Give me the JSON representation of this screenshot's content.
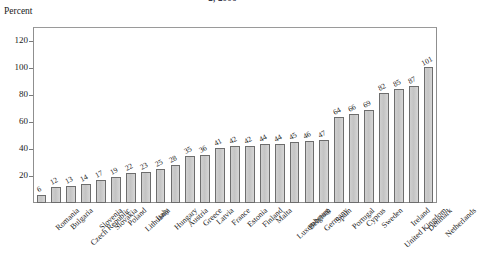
{
  "chart_data": {
    "type": "bar",
    "title": "2, 2006",
    "subtitle": "",
    "xlabel": "",
    "ylabel": "Percent",
    "ylim": [
      0,
      130
    ],
    "yticks": [
      20,
      40,
      60,
      80,
      100,
      120
    ],
    "grid": false,
    "legend": null,
    "orientation": "vertical",
    "bar_color": "#c8c8c8",
    "bar_edge_color": "#6d6d6d",
    "value_labels_shown": true,
    "categories": [
      "Romania",
      "Bulgaria",
      "Czech Republic",
      "Slovenia",
      "Slovakia",
      "Poland",
      "Lithuania",
      "Italy",
      "Hungary",
      "Austria",
      "Greece",
      "Latvia",
      "France",
      "Estonia",
      "Finland",
      "Malta",
      "Luxembourg",
      "Belgium",
      "Germany",
      "Spain",
      "Portugal",
      "Cyprus",
      "Sweden",
      "United Kingdom",
      "Ireland",
      "Denmark",
      "Netherlands"
    ],
    "values": [
      6,
      12,
      13,
      14,
      17,
      19,
      22,
      23,
      25,
      28,
      35,
      36,
      41,
      42,
      42,
      44,
      44,
      45,
      46,
      47,
      64,
      66,
      69,
      82,
      85,
      87,
      101
    ],
    "values_full": [
      6,
      12,
      13,
      14,
      17,
      19,
      22,
      23,
      25,
      28,
      35,
      36,
      41,
      42,
      42,
      44,
      44,
      45,
      46,
      47,
      64,
      66,
      69,
      82,
      85,
      87,
      101,
      107
    ]
  },
  "axis": {
    "y_caption": "Percent"
  }
}
